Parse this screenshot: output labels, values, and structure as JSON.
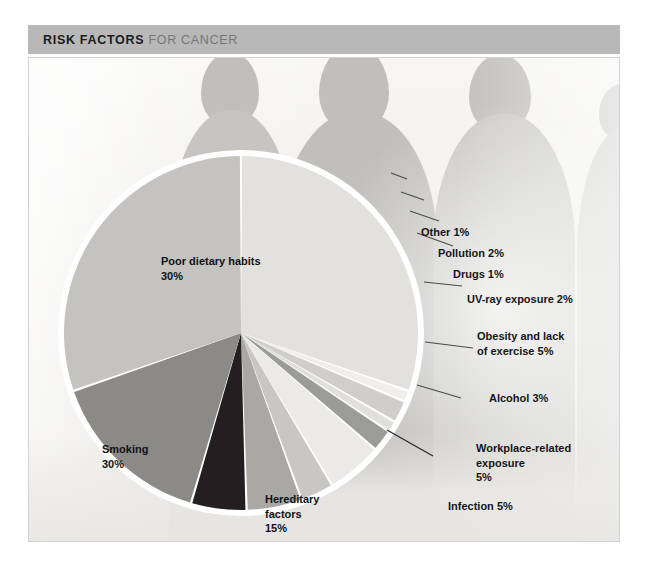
{
  "header": {
    "title_strong": "RISK FACTORS",
    "title_light": "FOR CANCER"
  },
  "figure": {
    "caption": "Figure 2"
  },
  "labels": {
    "poor_dietary_habits": "Poor dietary habits\n30%",
    "smoking": "Smoking\n30%",
    "hereditary_factors": "Hereditary\nfactors\n15%",
    "other": "Other  1%",
    "pollution": "Pollution  2%",
    "drugs": "Drugs  1%",
    "uv_ray_exposure": "UV-ray exposure  2%",
    "obesity": "Obesity and lack\nof exercise  5%",
    "alcohol": "Alcohol  3%",
    "workplace": "Workplace-related exposure\n5%",
    "infection": "Infection  5%"
  },
  "chart_data": {
    "type": "pie",
    "title": "RISK FACTORS FOR CANCER",
    "unit": "%",
    "total": 100,
    "legend": "none (slice labels)",
    "start_angle_deg": -90,
    "direction": "clockwise",
    "categories": [
      "Poor dietary habits",
      "Other",
      "Pollution",
      "Drugs",
      "UV-ray exposure",
      "Obesity and lack of exercise",
      "Alcohol",
      "Workplace-related exposure",
      "Infection",
      "Hereditary factors",
      "Smoking"
    ],
    "values": [
      30,
      1,
      2,
      1,
      2,
      5,
      3,
      5,
      5,
      15,
      30
    ],
    "colors": [
      "#e2e1dd",
      "#efeeea",
      "#cfcecb",
      "#e0dfdb",
      "#9b9b98",
      "#eceae6",
      "#c8c7c3",
      "#a9a8a5",
      "#231f20",
      "#8b8a87",
      "#c4c3bf"
    ],
    "slice_gap": "white separator between slices",
    "labels_inside": [
      "Poor dietary habits",
      "Smoking",
      "Hereditary factors"
    ],
    "labels_outside": [
      "Other",
      "Pollution",
      "Drugs",
      "UV-ray exposure",
      "Obesity and lack of exercise",
      "Alcohol",
      "Workplace-related exposure",
      "Infection"
    ]
  }
}
